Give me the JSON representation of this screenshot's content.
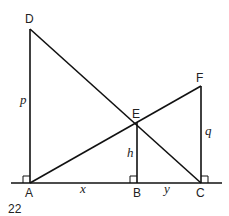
{
  "figure": {
    "number": "22",
    "points": {
      "A": "A",
      "B": "B",
      "C": "C",
      "D": "D",
      "E": "E",
      "F": "F"
    },
    "variables": {
      "p": "p",
      "q": "q",
      "h": "h",
      "x": "x",
      "y": "y"
    },
    "segments": [
      {
        "from": "A",
        "to": "D",
        "label": "p"
      },
      {
        "from": "C",
        "to": "F",
        "label": "q"
      },
      {
        "from": "B",
        "to": "E",
        "label": "h"
      },
      {
        "from": "A",
        "to": "B",
        "label": "x"
      },
      {
        "from": "B",
        "to": "C",
        "label": "y"
      },
      {
        "from": "D",
        "to": "C",
        "label": ""
      },
      {
        "from": "A",
        "to": "F",
        "label": ""
      }
    ],
    "right_angles": [
      "A",
      "B",
      "C"
    ]
  }
}
